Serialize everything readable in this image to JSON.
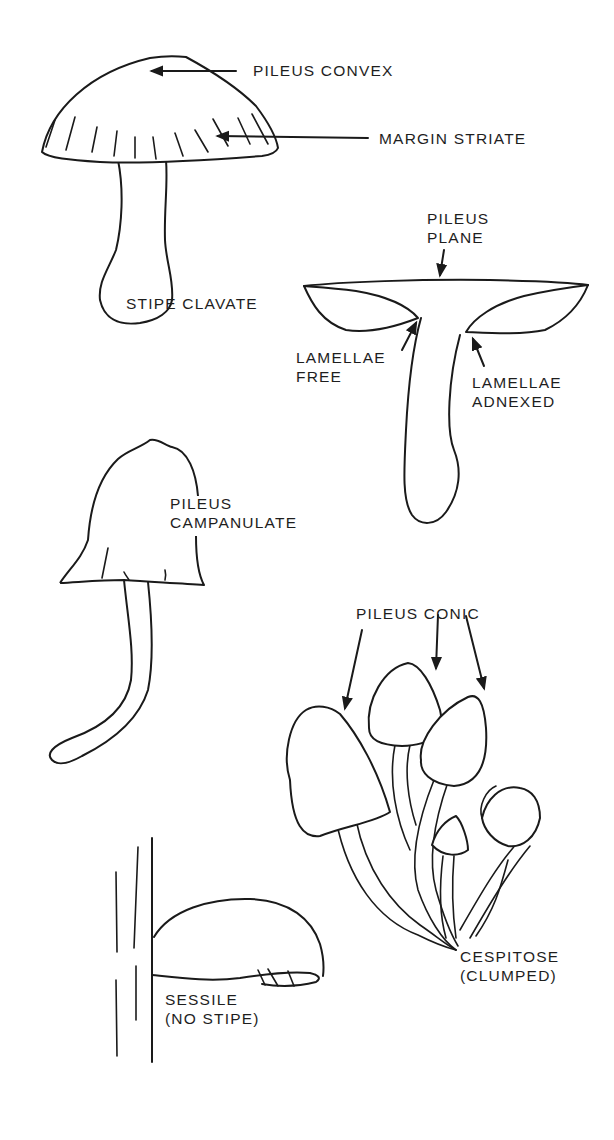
{
  "diagram": {
    "ink_color": "#1a1a1a",
    "background_color": "#ffffff",
    "figures": [
      {
        "id": "convex",
        "labels": {
          "pileus": "PILEUS CONVEX",
          "margin": "MARGIN STRIATE",
          "stipe": "STIPE CLAVATE"
        }
      },
      {
        "id": "plane",
        "labels": {
          "pileus_line1": "PILEUS",
          "pileus_line2": "PLANE",
          "free_line1": "LAMELLAE",
          "free_line2": "FREE",
          "adnexed_line1": "LAMELLAE",
          "adnexed_line2": "ADNEXED"
        }
      },
      {
        "id": "campanulate",
        "labels": {
          "line1": "PILEUS",
          "line2": "CAMPANULATE"
        }
      },
      {
        "id": "conic",
        "labels": {
          "pileus": "PILEUS CONIC",
          "cespitose_line1": "CESPITOSE",
          "cespitose_line2": "(CLUMPED)"
        }
      },
      {
        "id": "sessile",
        "labels": {
          "line1": "SESSILE",
          "line2": "(NO STIPE)"
        }
      }
    ]
  }
}
